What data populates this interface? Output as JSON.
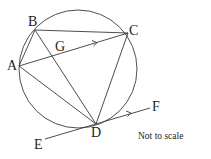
{
  "diagram": {
    "type": "circle-geometry",
    "stroke_color": "#3a3a3a",
    "text_color": "#231f20",
    "circle": {
      "cx": 78,
      "cy": 69,
      "r": 59
    },
    "points": {
      "A": {
        "label": "A",
        "x": 19,
        "y": 66
      },
      "B": {
        "label": "B",
        "x": 35,
        "y": 30
      },
      "C": {
        "label": "C",
        "x": 128,
        "y": 33
      },
      "D": {
        "label": "D",
        "x": 96,
        "y": 124
      },
      "G": {
        "label": "G"
      },
      "E": {
        "label": "E",
        "x": 45,
        "y": 139
      },
      "F": {
        "label": "F",
        "x": 150,
        "y": 108
      }
    },
    "segments": [
      "AB",
      "BC",
      "CD",
      "AD",
      "BD",
      "AC",
      "EF"
    ],
    "parallel_marks": [
      "AC",
      "EF"
    ],
    "tangent": "EF at D",
    "note": "Not to scale"
  }
}
